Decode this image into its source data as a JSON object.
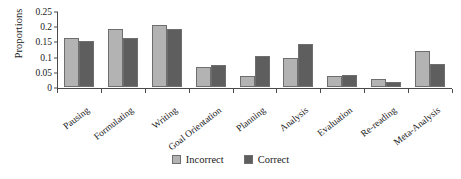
{
  "chart_data": {
    "type": "bar",
    "title": "",
    "xlabel": "",
    "ylabel": "Proportions",
    "ylim": [
      0,
      0.25
    ],
    "yticks": [
      "0",
      "0.05",
      "0.1",
      "0.15",
      "0.2",
      "0.25"
    ],
    "ytick_values": [
      0,
      0.05,
      0.1,
      0.15,
      0.2,
      0.25
    ],
    "grid": false,
    "legend_position": "bottom-center",
    "categories": [
      "Pausing",
      "Formulating",
      "Writing",
      "Goal Orientation",
      "Planning",
      "Analysis",
      "Evaluation",
      "Re-reading",
      "Meta-Analysis"
    ],
    "series": [
      {
        "name": "Incorrect",
        "color": "#b3b3b3",
        "values": [
          0.16,
          0.19,
          0.205,
          0.065,
          0.035,
          0.095,
          0.037,
          0.027,
          0.117
        ]
      },
      {
        "name": "Correct",
        "color": "#5e5e5e",
        "values": [
          0.151,
          0.162,
          0.191,
          0.074,
          0.103,
          0.143,
          0.038,
          0.017,
          0.075
        ]
      }
    ]
  },
  "colors": {
    "incorrect": "#b3b3b3",
    "correct": "#5e5e5e",
    "axis": "#4a4a4a",
    "bar_outline": "#6e6e6e",
    "background": "#ffffff"
  }
}
